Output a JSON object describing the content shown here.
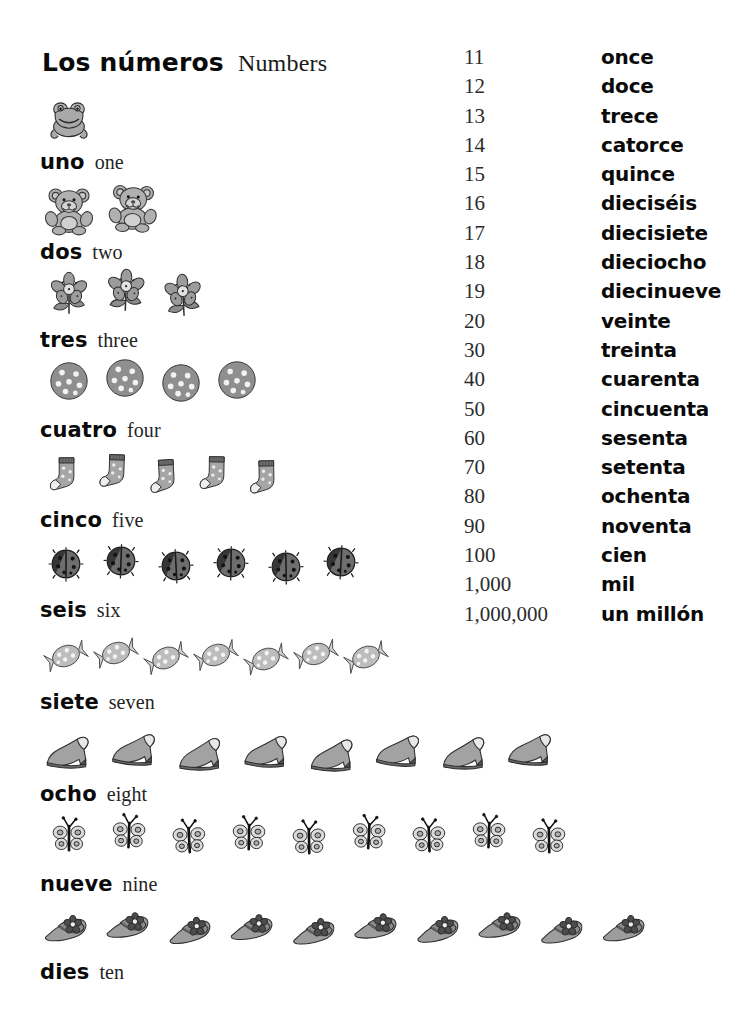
{
  "page": {
    "title_es": "Los números",
    "title_en": "Numbers",
    "background_color": "#ffffff",
    "text_color": "#0a0a0a"
  },
  "counting": [
    {
      "number": 1,
      "word_es": "uno",
      "word_en": "one",
      "icon": "frog-icon",
      "icon_count": 1,
      "icon_top": 96,
      "icon_left": 46,
      "icon_step": 0,
      "icon_size": 46,
      "label_top": 150
    },
    {
      "number": 2,
      "word_es": "dos",
      "word_en": "two",
      "icon": "teddy-bear-icon",
      "icon_count": 2,
      "icon_top": 184,
      "icon_left": 44,
      "icon_step": 64,
      "icon_size": 50,
      "label_top": 240
    },
    {
      "number": 3,
      "word_es": "tres",
      "word_en": "three",
      "icon": "flower-icon",
      "icon_count": 3,
      "icon_top": 270,
      "icon_left": 46,
      "icon_step": 57,
      "icon_size": 46,
      "label_top": 328
    },
    {
      "number": 4,
      "word_es": "cuatro",
      "word_en": "four",
      "icon": "cookie-icon",
      "icon_count": 4,
      "icon_top": 360,
      "icon_left": 48,
      "icon_step": 56,
      "icon_size": 42,
      "label_top": 418
    },
    {
      "number": 5,
      "word_es": "cinco",
      "word_en": "five",
      "icon": "sock-icon",
      "icon_count": 5,
      "icon_top": 452,
      "icon_left": 46,
      "icon_step": 50,
      "icon_size": 44,
      "label_top": 508
    },
    {
      "number": 6,
      "word_es": "seis",
      "word_en": "six",
      "icon": "ladybug-icon",
      "icon_count": 6,
      "icon_top": 546,
      "icon_left": 48,
      "icon_step": 55,
      "icon_size": 36,
      "label_top": 598
    },
    {
      "number": 7,
      "word_es": "siete",
      "word_en": "seven",
      "icon": "candy-icon",
      "icon_count": 7,
      "icon_top": 634,
      "icon_left": 44,
      "icon_step": 50,
      "icon_size": 44,
      "label_top": 690
    },
    {
      "number": 8,
      "word_es": "ocho",
      "word_en": "eight",
      "icon": "shoe-icon",
      "icon_count": 8,
      "icon_top": 726,
      "icon_left": 44,
      "icon_step": 66,
      "icon_size": 50,
      "label_top": 782
    },
    {
      "number": 9,
      "word_es": "nueve",
      "word_en": "nine",
      "icon": "butterfly-icon",
      "icon_count": 9,
      "icon_top": 816,
      "icon_left": 50,
      "icon_step": 60,
      "icon_size": 38,
      "label_top": 872
    },
    {
      "number": 10,
      "word_es": "dies",
      "word_en": "ten",
      "icon": "hat-icon",
      "icon_count": 10,
      "icon_top": 902,
      "icon_left": 44,
      "icon_step": 62,
      "icon_size": 48,
      "label_top": 960
    }
  ],
  "number_table": {
    "rows": [
      {
        "digits": "11",
        "word": "once"
      },
      {
        "digits": "12",
        "word": "doce"
      },
      {
        "digits": "13",
        "word": "trece"
      },
      {
        "digits": "14",
        "word": "catorce"
      },
      {
        "digits": "15",
        "word": "quince"
      },
      {
        "digits": "16",
        "word": "dieciséis"
      },
      {
        "digits": "17",
        "word": "diecisiete"
      },
      {
        "digits": "18",
        "word": "dieciocho"
      },
      {
        "digits": "19",
        "word": "diecinueve"
      },
      {
        "digits": "20",
        "word": "veinte"
      },
      {
        "digits": "30",
        "word": "treinta"
      },
      {
        "digits": "40",
        "word": "cuarenta"
      },
      {
        "digits": "50",
        "word": "cincuenta"
      },
      {
        "digits": "60",
        "word": "sesenta"
      },
      {
        "digits": "70",
        "word": "setenta"
      },
      {
        "digits": "80",
        "word": "ochenta"
      },
      {
        "digits": "90",
        "word": "noventa"
      },
      {
        "digits": "100",
        "word": "cien"
      },
      {
        "digits": "1,000",
        "word": "mil"
      },
      {
        "digits": "1,000,000",
        "word": "un millón"
      }
    ]
  }
}
